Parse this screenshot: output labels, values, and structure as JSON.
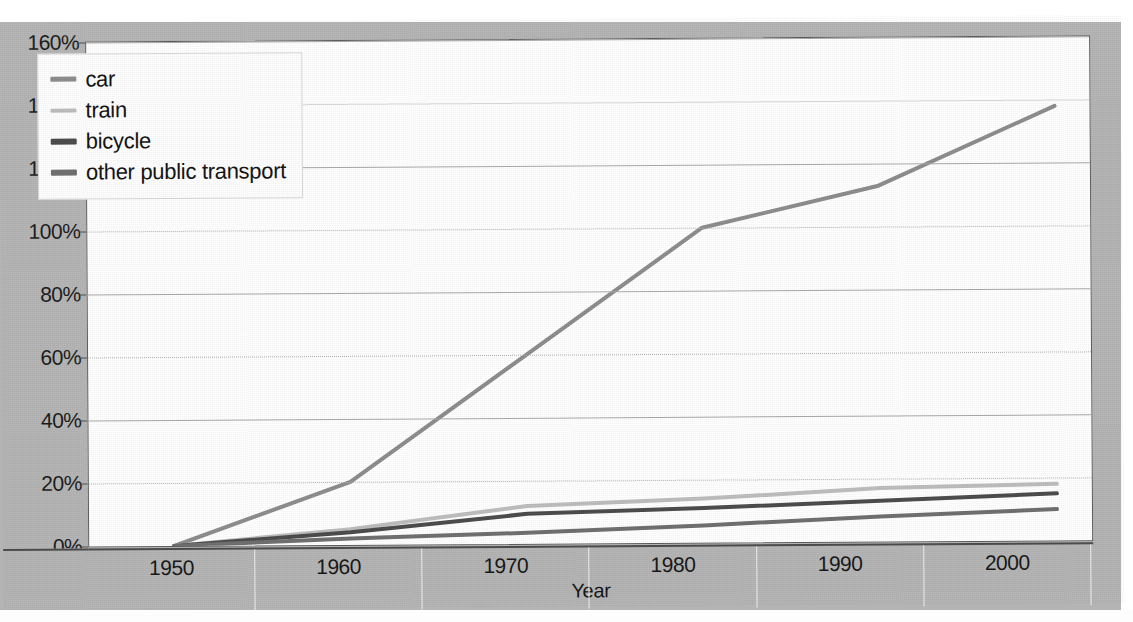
{
  "chart_data": {
    "type": "line",
    "title": "",
    "xlabel": "Year",
    "ylabel": "",
    "x": [
      1950,
      1960,
      1970,
      1980,
      1990,
      2000
    ],
    "categories": [
      "1950",
      "1960",
      "1970",
      "1980",
      "1990",
      "2000"
    ],
    "xtick_labels": [
      "1950",
      "1960",
      "1970",
      "1980",
      "1990",
      "2000"
    ],
    "ytick_labels": [
      "0%",
      "20%",
      "40%",
      "60%",
      "80%",
      "100%",
      "120%",
      "140%",
      "160%"
    ],
    "ytick_values": [
      0,
      20,
      40,
      60,
      80,
      100,
      120,
      140,
      160
    ],
    "ylim": [
      0,
      160
    ],
    "xlim": [
      1950,
      2000
    ],
    "grid": "horizontal",
    "legend_position": "top-left",
    "series": [
      {
        "name": "car",
        "color": "#8c8c8c",
        "width": 4.0,
        "values": [
          0,
          20,
          60,
          100,
          113,
          138
        ]
      },
      {
        "name": "train",
        "color": "#bdbdbd",
        "width": 4.0,
        "values": [
          0,
          5,
          12,
          14,
          17,
          18
        ]
      },
      {
        "name": "bicycle",
        "color": "#4a4a4a",
        "width": 4.0,
        "values": [
          0,
          4,
          9.5,
          11,
          13,
          15
        ]
      },
      {
        "name": "other public transport",
        "color": "#6e6e6e",
        "width": 4.0,
        "values": [
          0,
          2,
          3.5,
          5.5,
          8,
          10
        ]
      }
    ]
  },
  "legend": {
    "items": [
      {
        "label": "car",
        "color": "#8c8c8c"
      },
      {
        "label": "train",
        "color": "#bdbdbd"
      },
      {
        "label": "bicycle",
        "color": "#4a4a4a"
      },
      {
        "label": "other public transport",
        "color": "#6e6e6e"
      }
    ]
  },
  "axes": {
    "x_title": "Year",
    "y_title": ""
  },
  "bleed_through": {
    "line1": "ding graphs, tables and charts",
    "line2": "transport"
  },
  "colors": {
    "page_background": "#ffffff",
    "chart_background": "#b4b4b4",
    "plot_background": "#ffffff",
    "gridline": "#a9a9a9",
    "frame": "#5a5a5a",
    "text": "#141414"
  }
}
